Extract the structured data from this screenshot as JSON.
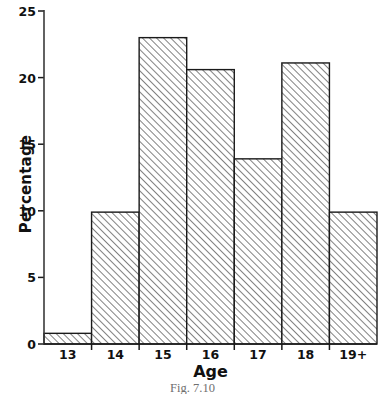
{
  "chart_data": {
    "type": "bar",
    "title": "",
    "caption": "Fig. 7.10",
    "xlabel": "Age",
    "ylabel": "Percentage",
    "categories": [
      "13",
      "14",
      "15",
      "16",
      "17",
      "18",
      "19+"
    ],
    "values": [
      0.8,
      9.9,
      23.0,
      20.6,
      13.9,
      21.1,
      9.9
    ],
    "ylim": [
      0,
      25
    ],
    "yticks": [
      0,
      5,
      10,
      15,
      20,
      25
    ],
    "ytick_labels": [
      "0",
      "5",
      "10",
      "15",
      "20",
      "25"
    ],
    "grid": false,
    "legend": "none",
    "bar_style": {
      "fill": "diagonal-hatch",
      "hatch_color": "#1a1a1a",
      "background": "#ffffff",
      "edge_color": "#1a1a1a"
    }
  },
  "axes": {
    "line_color": "#3a3a3a",
    "tick_color": "#1a1a1a"
  }
}
